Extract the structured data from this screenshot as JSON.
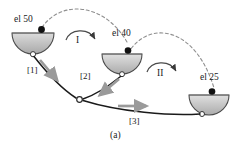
{
  "figure": {
    "caption": "(a)",
    "bowls": [
      {
        "id": "bowl-el50",
        "label": "el 50",
        "elevation": 50,
        "cx": 33,
        "cy": 36,
        "r": 21
      },
      {
        "id": "bowl-el40",
        "label": "el 40",
        "elevation": 40,
        "cx": 122,
        "cy": 57,
        "r": 20
      },
      {
        "id": "bowl-el25",
        "label": "el 25",
        "elevation": 25,
        "cx": 209,
        "cy": 98,
        "r": 20
      }
    ],
    "phase_labels": [
      {
        "id": "phase-I",
        "label": "I"
      },
      {
        "id": "phase-II",
        "label": "II"
      }
    ],
    "segment_labels": [
      {
        "id": "segment-1",
        "label": "[1]"
      },
      {
        "id": "segment-2",
        "label": "[2]"
      },
      {
        "id": "segment-3",
        "label": "[3]"
      }
    ],
    "colors": {
      "bowl_fill": "#b9b9b9",
      "bowl_fill_light": "#d4d4d4",
      "bowl_stroke": "#4a4a4a",
      "ball": "#111111",
      "node_fill": "#ffffff",
      "node_stroke": "#333333",
      "path_line": "#1a1a1a",
      "dashed_arc": "#8a8a8a",
      "thick_arrow": "#9a9a9a",
      "text": "#1a1a1a"
    }
  }
}
